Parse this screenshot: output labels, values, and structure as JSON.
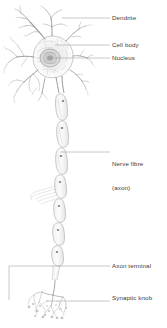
{
  "diagram": {
    "style": "pencil-sketch line drawing",
    "background_color": "#ffffff",
    "ink_color": "#8c8c8c",
    "leader_line_color": "#9a9a9a",
    "label_text_color": "#3c3c3c",
    "width_px": 167,
    "height_px": 328
  },
  "labels": {
    "dendrite": "Dendrite",
    "cell_body": "Cell body",
    "nucleus": "Nucleus",
    "nerve_fibre_line1": "Nerve fibre",
    "nerve_fibre_line2": "(axon)",
    "axon_terminal": "Axon terminal",
    "synaptic_knob": "Synaptic knob"
  },
  "callouts": [
    {
      "id": "dendrite",
      "label": "Dendrite",
      "leader_y": 18,
      "leader_x_start": 62,
      "leader_x_end": 110,
      "type": "line"
    },
    {
      "id": "cell-body",
      "label": "Cell body",
      "leader_y": 45,
      "leader_x_start": 55,
      "leader_x_end": 110,
      "type": "line"
    },
    {
      "id": "nucleus",
      "label": "Nucleus",
      "leader_y": 58,
      "leader_x_start": 50,
      "leader_x_end": 110,
      "type": "line"
    },
    {
      "id": "nerve-fibre",
      "label": "Nerve fibre (axon)",
      "leader_y": 152,
      "leader_x_start": 60,
      "leader_x_end": 110,
      "type": "line"
    },
    {
      "id": "axon-terminal",
      "label": "Axon terminal",
      "leader_y": 266,
      "leader_x_start": 9,
      "leader_x_end": 110,
      "type": "bracket"
    },
    {
      "id": "synaptic-knob",
      "label": "Synaptic knob",
      "leader_y": 301,
      "leader_x_start": 46,
      "leader_x_end": 110,
      "type": "line"
    }
  ],
  "parts": {
    "soma_center": {
      "x": 52,
      "y": 56
    },
    "nucleus_center": {
      "x": 50,
      "y": 59
    },
    "axon_top": {
      "x": 60,
      "y": 92
    },
    "axon_bottom": {
      "x": 55,
      "y": 272
    },
    "terminal_tree_center": {
      "x": 50,
      "y": 305
    },
    "myelin_segment_count": 9
  }
}
